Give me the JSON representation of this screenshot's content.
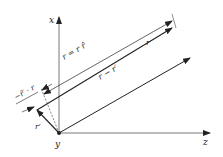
{
  "diagram": {
    "axes": {
      "x_label": "x",
      "y_label": "y",
      "z_label": "z"
    },
    "labels": {
      "r_def": "r = r r̂",
      "r": "r",
      "r_minus_rprime": "r − r′",
      "rprime": "r′",
      "projection": "−r̂′ · r"
    },
    "colors": {
      "line": "#222222",
      "background": "#ffffff"
    }
  }
}
